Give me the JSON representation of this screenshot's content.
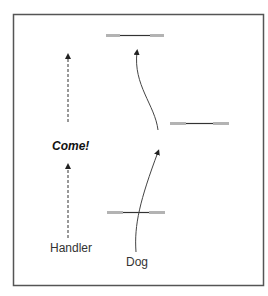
{
  "diagram": {
    "labels": {
      "come": "Come!",
      "handler": "Handler",
      "dog": "Dog"
    },
    "colors": {
      "border": "#555555",
      "bar_end": "#b3b3b3",
      "bar_mid": "#333333",
      "path": "#444444",
      "handler_path": "#333333"
    },
    "jumps": [
      {
        "name": "jump-top"
      },
      {
        "name": "jump-right"
      },
      {
        "name": "jump-bottom"
      }
    ]
  }
}
